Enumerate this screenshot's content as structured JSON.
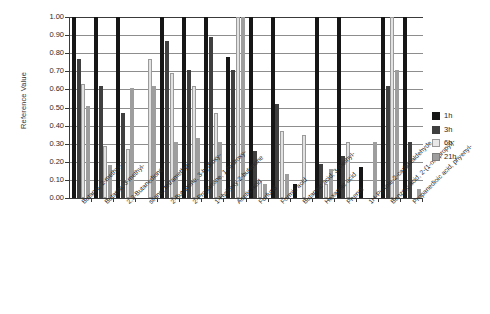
{
  "chart_data": {
    "type": "bar",
    "title": "",
    "xlabel": "",
    "ylabel": "Reference Value",
    "ylim": [
      0.0,
      1.0
    ],
    "yticks": [
      "0.00",
      "0.10",
      "0.20",
      "0.30",
      "0.40",
      "0.50",
      "0.60",
      "0.70",
      "0.80",
      "0.90",
      "1.00"
    ],
    "grid": true,
    "legend_position": "right",
    "categories": [
      "Butanal, 2-methyl-",
      "Butanal, 3-methyl-",
      "2,3-Butanedione",
      "silane, tetramethyl-",
      "2-Butanone, 3-hydroxy-",
      "2-Propanone, 1-hydroxy-",
      "1-Hydroxy-2-butanone",
      "Acetic acid",
      "Furfural",
      "Formic acid",
      "Butanoic acid, 3-methyl-",
      "Hexanoic acid",
      "Phenol",
      "1H-Pyrrole-2-carboxaldehyde",
      "Benzoic acid, 2-(1-oxopropyl)-",
      "Propanedioic acid, phyenyl-"
    ],
    "series": [
      {
        "name": "1h",
        "color": "#161616",
        "values": [
          1.0,
          1.0,
          1.0,
          0.0,
          1.0,
          1.0,
          1.0,
          0.78,
          1.0,
          1.0,
          0.08,
          1.0,
          1.0,
          0.17,
          1.0,
          1.0
        ]
      },
      {
        "name": "3h",
        "color": "#3f3f3f",
        "values": [
          0.77,
          0.62,
          0.47,
          0.0,
          0.87,
          0.71,
          0.89,
          0.71,
          0.26,
          0.52,
          0.0,
          0.19,
          0.23,
          0.0,
          0.62,
          0.31
        ]
      },
      {
        "name": "6h",
        "color": "#e2e2e2",
        "values": [
          0.63,
          0.29,
          0.27,
          0.77,
          0.69,
          0.62,
          0.47,
          1.0,
          0.1,
          0.37,
          0.35,
          0.08,
          0.31,
          0.0,
          1.0,
          0.0
        ]
      },
      {
        "name": "21h",
        "color": "#9e9e9e",
        "values": [
          0.51,
          0.18,
          0.61,
          0.62,
          0.31,
          0.33,
          0.31,
          1.0,
          0.08,
          0.13,
          0.0,
          0.16,
          0.0,
          0.31,
          0.71,
          0.05
        ]
      }
    ],
    "legend": [
      "1h",
      "3h",
      "6h",
      "21h"
    ]
  }
}
